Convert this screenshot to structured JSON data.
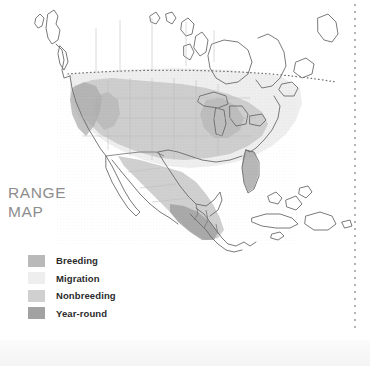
{
  "page": {
    "caption_line1": "RANGE",
    "caption_line2": "MAP",
    "caption_color": "#8d8d8d",
    "background": "#ffffff"
  },
  "legend": {
    "items": [
      {
        "label": "Breeding",
        "color": "#b9b9b9",
        "key": "breeding"
      },
      {
        "label": "Migration",
        "color": "#eeeeee",
        "key": "migration"
      },
      {
        "label": "Nonbreeding",
        "color": "#d0d0d0",
        "key": "nonbreeding"
      },
      {
        "label": "Year-round",
        "color": "#a2a2a2",
        "key": "year-round"
      }
    ]
  },
  "map": {
    "title": "North America range map",
    "region": "North America, Central America and the Caribbean",
    "outline_color": "#6b6b6b",
    "state_border_color": "#b4b4b4",
    "country_border_color": "#7a7a7a",
    "dotted_border_color": "#777777",
    "water_color": "#ffffff",
    "land_unshaded_color": "#ffffff",
    "shading": {
      "breeding": "#b9b9b9",
      "migration": "#eeeeee",
      "nonbreeding": "#d0d0d0",
      "year_round": "#a2a2a2"
    },
    "features": [
      "Alaska",
      "Canada",
      "Hudson Bay",
      "Great Lakes",
      "Newfoundland",
      "United States",
      "Florida",
      "Gulf of Mexico",
      "Mexico",
      "Baja California",
      "Central America",
      "Cuba",
      "Bahamas",
      "Hispaniola",
      "Jamaica"
    ]
  },
  "column_rule": {
    "style": "dotted",
    "color": "#9a9a9a"
  }
}
